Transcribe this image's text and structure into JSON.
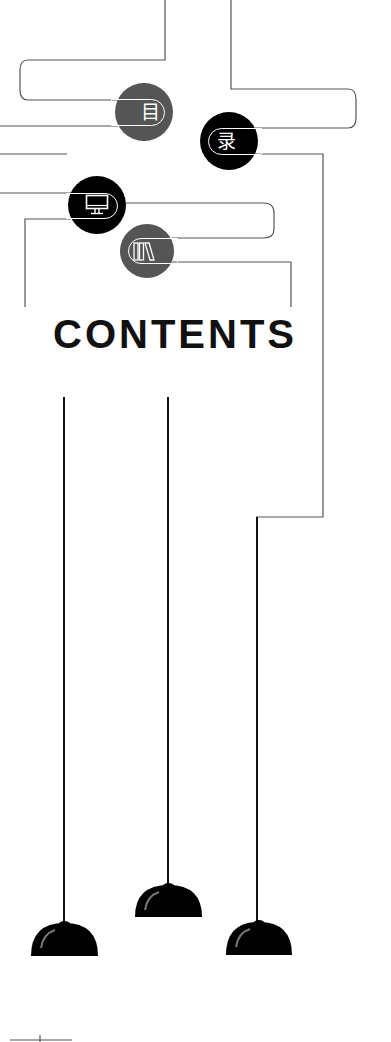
{
  "title": "CONTENTS",
  "badges": [
    {
      "id": "mu",
      "label": "目",
      "icon": "mu-character",
      "color": "#555555",
      "cx": 144,
      "cy": 112,
      "r": 29
    },
    {
      "id": "lu",
      "label": "录",
      "icon": "lu-character",
      "color": "#000000",
      "cx": 229,
      "cy": 141,
      "r": 29
    },
    {
      "id": "monitor",
      "label": "",
      "icon": "monitor-icon",
      "color": "#000000",
      "cx": 97,
      "cy": 205,
      "r": 29
    },
    {
      "id": "books",
      "label": "",
      "icon": "books-icon",
      "color": "#555555",
      "cx": 147,
      "cy": 251,
      "r": 27
    }
  ],
  "colors": {
    "line": "#555555",
    "cord": "#111111",
    "lamp": "#000000",
    "badge_dark": "#000000",
    "badge_gray": "#555555",
    "text": "#111111"
  },
  "lamps": [
    {
      "id": "left",
      "cord_x": 64,
      "cord_top": 397,
      "dome_left": 31,
      "dome_top": 921,
      "dome_width": 67,
      "dome_height": 35
    },
    {
      "id": "middle",
      "cord_x": 168,
      "cord_top": 397,
      "dome_left": 135,
      "dome_top": 883,
      "dome_width": 67,
      "dome_height": 34
    },
    {
      "id": "right",
      "cord_x": 259,
      "cord_top": 517,
      "dome_left": 226,
      "dome_top": 920,
      "dome_width": 66,
      "dome_height": 35
    }
  ]
}
